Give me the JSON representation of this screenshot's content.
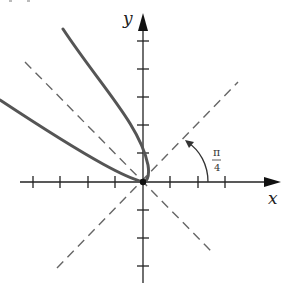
{
  "figure": {
    "panel_label": "(c)",
    "x_axis_label": "x",
    "y_axis_label": "y",
    "angle_label_numerator": "π",
    "angle_label_denominator": "4",
    "angle_label": "π/4"
  },
  "geometry": {
    "origin": [
      143,
      182
    ],
    "tick_spacing_px": 27.5,
    "x_ticks_px": [
      33,
      60,
      88,
      115,
      170,
      198,
      225
    ],
    "y_ticks_px": [
      41,
      69,
      97,
      125,
      153,
      210,
      238,
      266
    ],
    "colors": {
      "axis": "#222222",
      "curve": "#555555",
      "dashed": "#666666"
    }
  }
}
